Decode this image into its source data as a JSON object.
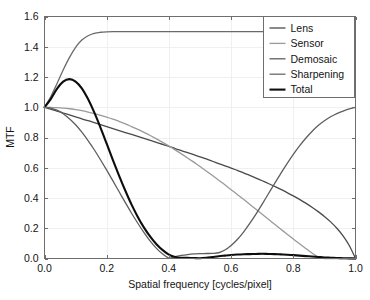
{
  "chart_data": {
    "type": "line",
    "title": "",
    "xlabel": "Spatial frequency [cycles/pixel]",
    "ylabel": "MTF",
    "xlim": [
      0.0,
      1.0
    ],
    "ylim": [
      0.0,
      1.6
    ],
    "xticks": [
      "0.0",
      "0.2",
      "0.4",
      "0.6",
      "0.8",
      "1.0"
    ],
    "xtick_values": [
      0.0,
      0.2,
      0.4,
      0.6,
      0.8,
      1.0
    ],
    "yticks": [
      "0.0",
      "0.2",
      "0.4",
      "0.6",
      "0.8",
      "1.0",
      "1.2",
      "1.4",
      "1.6"
    ],
    "ytick_values": [
      0.0,
      0.2,
      0.4,
      0.6,
      0.8,
      1.0,
      1.2,
      1.4,
      1.6
    ],
    "grid": true,
    "legend_position": "upper right",
    "x": [
      0.0,
      0.02,
      0.04,
      0.06,
      0.08,
      0.1,
      0.12,
      0.14,
      0.16,
      0.18,
      0.2,
      0.22,
      0.24,
      0.26,
      0.28,
      0.3,
      0.32,
      0.34,
      0.36,
      0.38,
      0.4,
      0.42,
      0.44,
      0.46,
      0.48,
      0.5,
      0.52,
      0.54,
      0.56,
      0.58,
      0.6,
      0.62,
      0.64,
      0.66,
      0.68,
      0.7,
      0.72,
      0.74,
      0.76,
      0.78,
      0.8,
      0.82,
      0.84,
      0.86,
      0.88,
      0.9,
      0.92,
      0.94,
      0.96,
      0.98,
      1.0
    ],
    "series": [
      {
        "name": "Lens",
        "color": "#4a4a4a",
        "width": 1.3,
        "values": [
          1.0,
          0.987,
          0.975,
          0.962,
          0.949,
          0.936,
          0.923,
          0.911,
          0.898,
          0.885,
          0.872,
          0.859,
          0.846,
          0.833,
          0.82,
          0.807,
          0.794,
          0.781,
          0.768,
          0.754,
          0.741,
          0.727,
          0.714,
          0.7,
          0.686,
          0.672,
          0.658,
          0.643,
          0.628,
          0.613,
          0.598,
          0.582,
          0.566,
          0.549,
          0.532,
          0.514,
          0.496,
          0.477,
          0.457,
          0.436,
          0.414,
          0.391,
          0.366,
          0.339,
          0.31,
          0.278,
          0.242,
          0.2,
          0.15,
          0.086,
          0.0
        ]
      },
      {
        "name": "Sensor",
        "color": "#9a9a9a",
        "width": 1.3,
        "values": [
          1.0,
          0.999,
          0.997,
          0.994,
          0.99,
          0.984,
          0.977,
          0.968,
          0.958,
          0.947,
          0.935,
          0.921,
          0.906,
          0.89,
          0.872,
          0.854,
          0.834,
          0.813,
          0.791,
          0.768,
          0.744,
          0.718,
          0.692,
          0.665,
          0.637,
          0.608,
          0.579,
          0.549,
          0.518,
          0.487,
          0.455,
          0.423,
          0.391,
          0.358,
          0.325,
          0.292,
          0.259,
          0.226,
          0.193,
          0.161,
          0.129,
          0.097,
          0.066,
          0.036,
          0.01,
          0.0,
          0.0,
          0.0,
          0.0,
          0.0,
          0.0
        ]
      },
      {
        "name": "Demosaic",
        "color": "#5e5e5e",
        "width": 1.3,
        "values": [
          1.0,
          0.995,
          0.981,
          0.957,
          0.924,
          0.884,
          0.835,
          0.78,
          0.719,
          0.653,
          0.584,
          0.513,
          0.441,
          0.369,
          0.299,
          0.233,
          0.171,
          0.115,
          0.067,
          0.029,
          0.003,
          0.012,
          0.02,
          0.026,
          0.03,
          0.032,
          0.033,
          0.034,
          0.038,
          0.056,
          0.086,
          0.126,
          0.175,
          0.232,
          0.294,
          0.36,
          0.428,
          0.496,
          0.563,
          0.627,
          0.688,
          0.744,
          0.795,
          0.84,
          0.879,
          0.911,
          0.937,
          0.958,
          0.975,
          0.989,
          1.0
        ]
      },
      {
        "name": "Sharpening",
        "color": "#6a6a6a",
        "width": 1.3,
        "values": [
          1.0,
          1.069,
          1.156,
          1.246,
          1.328,
          1.396,
          1.444,
          1.473,
          1.489,
          1.496,
          1.499,
          1.5,
          1.5,
          1.5,
          1.5,
          1.5,
          1.5,
          1.5,
          1.5,
          1.5,
          1.5,
          1.5,
          1.5,
          1.5,
          1.5,
          1.5,
          1.5,
          1.5,
          1.5,
          1.5,
          1.5,
          1.5,
          1.5,
          1.5,
          1.5,
          1.5,
          1.5,
          1.5,
          1.5,
          1.5,
          1.5,
          1.5,
          1.5,
          1.5,
          1.5,
          1.5,
          1.5,
          1.5,
          1.5,
          1.5,
          1.5
        ]
      },
      {
        "name": "Total",
        "color": "#0d0d0d",
        "width": 2.1,
        "values": [
          1.0,
          1.054,
          1.122,
          1.169,
          1.186,
          1.17,
          1.125,
          1.054,
          0.966,
          0.866,
          0.759,
          0.651,
          0.547,
          0.448,
          0.356,
          0.275,
          0.204,
          0.144,
          0.094,
          0.055,
          0.026,
          0.01,
          0.005,
          0.004,
          0.003,
          0.002,
          0.005,
          0.01,
          0.015,
          0.019,
          0.023,
          0.026,
          0.028,
          0.029,
          0.03,
          0.031,
          0.03,
          0.029,
          0.027,
          0.025,
          0.022,
          0.019,
          0.016,
          0.013,
          0.01,
          0.007,
          0.005,
          0.003,
          0.002,
          0.001,
          0.0
        ]
      }
    ]
  },
  "axes": {
    "x_title": "Spatial frequency [cycles/pixel]",
    "y_title": "MTF"
  },
  "legend": {
    "items": [
      {
        "label": "Lens"
      },
      {
        "label": "Sensor"
      },
      {
        "label": "Demosaic"
      },
      {
        "label": "Sharpening"
      },
      {
        "label": "Total"
      }
    ]
  },
  "colors": {
    "background": "#ffffff",
    "frame": "#6e6e6e",
    "grid": "#e9e9ef",
    "text": "#141414"
  }
}
